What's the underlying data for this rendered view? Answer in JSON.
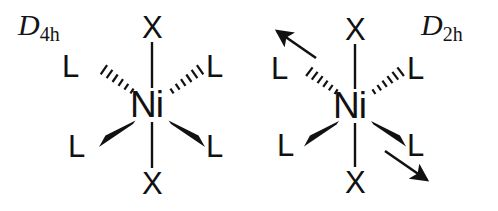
{
  "figure": {
    "type": "chemical-structure-diagram",
    "background_color": "#ffffff",
    "line_color": "#111111"
  },
  "structures": [
    {
      "id": "d4h",
      "point_group": {
        "symbol": "D",
        "subscript": "4h"
      },
      "center_atom": "Ni",
      "axial_ligands": [
        {
          "label": "X",
          "position": "top",
          "bond": "plain"
        },
        {
          "label": "X",
          "position": "bottom",
          "bond": "plain"
        }
      ],
      "equatorial_ligands": [
        {
          "label": "L",
          "position": "upper-left",
          "bond": "hashed-wedge"
        },
        {
          "label": "L",
          "position": "upper-right",
          "bond": "hashed-wedge"
        },
        {
          "label": "L",
          "position": "lower-left",
          "bond": "solid-wedge"
        },
        {
          "label": "L",
          "position": "lower-right",
          "bond": "solid-wedge"
        }
      ],
      "arrows": []
    },
    {
      "id": "d2h",
      "point_group": {
        "symbol": "D",
        "subscript": "2h"
      },
      "center_atom": "Ni",
      "axial_ligands": [
        {
          "label": "X",
          "position": "top",
          "bond": "plain"
        },
        {
          "label": "X",
          "position": "bottom",
          "bond": "plain"
        }
      ],
      "equatorial_ligands": [
        {
          "label": "L",
          "position": "upper-left",
          "bond": "hashed-wedge"
        },
        {
          "label": "L",
          "position": "upper-right",
          "bond": "hashed-wedge"
        },
        {
          "label": "L",
          "position": "lower-left",
          "bond": "solid-wedge"
        },
        {
          "label": "L",
          "position": "lower-right",
          "bond": "solid-wedge"
        }
      ],
      "arrows": [
        {
          "direction": "up-left",
          "position": "upper-left"
        },
        {
          "direction": "down-right",
          "position": "lower-right"
        }
      ]
    }
  ]
}
